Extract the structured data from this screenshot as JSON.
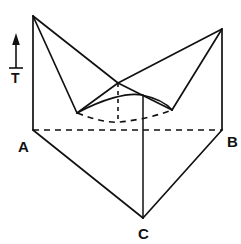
{
  "figure": {
    "kind": "line-diagram",
    "stroke_color": "#111111",
    "background_color": "#ffffff"
  },
  "axis": {
    "name": "temperature-axis",
    "label": "T",
    "direction": "up",
    "shaft": {
      "x": 16,
      "y_top": 40,
      "y_bottom": 68
    },
    "arrowhead": {
      "x": 16,
      "y": 36
    }
  },
  "vertices": [
    {
      "id": "A",
      "label": "A",
      "x": 33,
      "y": 130
    },
    {
      "id": "B",
      "label": "B",
      "x": 222,
      "y": 130
    },
    {
      "id": "C",
      "label": "C",
      "x": 143,
      "y": 218
    }
  ],
  "points": {
    "apex_left": {
      "x": 33,
      "y": 16
    },
    "apex_right": {
      "x": 222,
      "y": 29
    },
    "notch_center": {
      "x": 118,
      "y": 83
    },
    "valley_left": {
      "x": 77,
      "y": 113
    },
    "valley_right": {
      "x": 172,
      "y": 110
    },
    "base_front": {
      "x": 143,
      "y": 218
    },
    "base_left": {
      "x": 33,
      "y": 130
    },
    "base_right": {
      "x": 222,
      "y": 130
    },
    "crest_curve": {
      "x": 142,
      "y": 95
    },
    "dip_curve": {
      "x": 120,
      "y": 122
    }
  },
  "edges": {
    "solid": [
      {
        "name": "left-vertical-edge",
        "d": "M 33 16 L 33 130"
      },
      {
        "name": "right-vertical-edge",
        "d": "M 222 29 L 222 130"
      },
      {
        "name": "left-ridge-to-notch",
        "d": "M 33 16 L 118 83"
      },
      {
        "name": "right-ridge-to-notch",
        "d": "M 222 29 L 118 83"
      },
      {
        "name": "left-fold-to-valley",
        "d": "M 33 16 L 77 113"
      },
      {
        "name": "right-fold-to-valley",
        "d": "M 222 29 L 172 110"
      },
      {
        "name": "notch-to-valley-left",
        "d": "M 118 83 L 77 113"
      },
      {
        "name": "notch-to-valley-right",
        "d": "M 118 83 L 172 110"
      },
      {
        "name": "front-face-left",
        "d": "M 33 130 L 143 218"
      },
      {
        "name": "front-face-right",
        "d": "M 222 130 L 143 218"
      },
      {
        "name": "center-vertical-front",
        "d": "M 143 218 L 143 95"
      },
      {
        "name": "surface-front-arc",
        "d": "M 77 113 C 103 99, 128 92, 142 95 C 156 98, 166 103, 172 110"
      }
    ],
    "hidden": [
      {
        "name": "baseline-a-to-b",
        "d": "M 33 130 L 222 130"
      },
      {
        "name": "surface-back-arc",
        "d": "M 77 113 C 96 120, 109 123, 120 122 C 140 120, 159 115, 172 110"
      },
      {
        "name": "center-vertical-hidden",
        "d": "M 118 83 L 118 122"
      }
    ]
  }
}
